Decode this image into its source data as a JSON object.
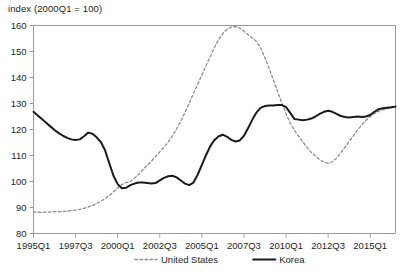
{
  "figure": {
    "clipped_title": "",
    "axis_note": "index (2000Q1 = 100)"
  },
  "chart_data": {
    "type": "line",
    "title": "",
    "subtitle": "index (2000Q1 = 100)",
    "xlabel": "",
    "ylabel": "index (2000Q1 = 100)",
    "ylim": [
      80,
      160
    ],
    "yticks": [
      80,
      90,
      100,
      110,
      120,
      130,
      140,
      150,
      160
    ],
    "ytick_labels": [
      "80",
      "90",
      "100",
      "110",
      "120",
      "130",
      "140",
      "150",
      "160"
    ],
    "xticks": [
      "1995Q1",
      "1997Q3",
      "2000Q1",
      "2002Q3",
      "2005Q1",
      "2007Q3",
      "2010Q1",
      "2012Q3",
      "2015Q1"
    ],
    "xtick_labels": [
      "1995Q1",
      "1997Q3",
      "2000Q1",
      "2002Q3",
      "2005Q1",
      "2007Q3",
      "2010Q1",
      "2012Q3",
      "2015Q1"
    ],
    "x_start": "1995Q1",
    "x_end": "2016Q3",
    "x_count": 87,
    "grid": false,
    "legend_position": "bottom-center",
    "colors": {
      "united_states": "#8c8c8c",
      "korea": "#1a1a1a",
      "axis": "#9a9a9a"
    },
    "series": [
      {
        "name": "United States",
        "style": "dotted",
        "color": "#8c8c8c",
        "values": [
          88.3,
          88.2,
          88.1,
          88.2,
          88.3,
          88.4,
          88.4,
          88.5,
          88.6,
          88.8,
          89.0,
          89.3,
          89.7,
          90.2,
          90.8,
          91.5,
          92.4,
          93.4,
          94.6,
          96.0,
          97.6,
          98.8,
          99.6,
          100.0,
          101.2,
          102.8,
          104.6,
          106.2,
          107.8,
          109.6,
          111.4,
          113.2,
          115.2,
          117.6,
          120.2,
          123.2,
          126.6,
          130.2,
          133.8,
          137.4,
          141.0,
          144.6,
          148.2,
          151.6,
          154.6,
          157.0,
          158.6,
          159.4,
          159.6,
          159.0,
          157.8,
          156.4,
          155.2,
          153.8,
          151.2,
          147.6,
          143.4,
          139.0,
          134.6,
          130.2,
          126.0,
          122.4,
          119.6,
          117.4,
          115.2,
          113.0,
          111.2,
          109.8,
          108.4,
          107.4,
          107.0,
          107.6,
          109.0,
          111.0,
          113.2,
          115.4,
          117.6,
          119.8,
          121.8,
          123.6,
          125.0,
          126.2,
          127.0,
          127.6,
          128.0,
          128.4,
          128.8
        ]
      },
      {
        "name": "Korea",
        "style": "solid",
        "color": "#1a1a1a",
        "values": [
          126.8,
          125.4,
          124.0,
          122.6,
          121.2,
          119.8,
          118.6,
          117.6,
          116.8,
          116.2,
          116.0,
          116.2,
          117.4,
          118.8,
          118.4,
          117.0,
          115.2,
          112.0,
          107.0,
          102.2,
          99.0,
          97.4,
          97.6,
          98.6,
          99.2,
          99.6,
          99.6,
          99.4,
          99.2,
          99.4,
          100.4,
          101.4,
          102.0,
          102.2,
          101.6,
          100.4,
          99.2,
          98.6,
          99.6,
          102.6,
          106.4,
          110.2,
          113.6,
          116.0,
          117.4,
          118.0,
          117.2,
          116.0,
          115.4,
          115.8,
          117.6,
          120.6,
          123.8,
          126.6,
          128.4,
          129.0,
          129.2,
          129.2,
          129.4,
          129.4,
          128.6,
          126.4,
          124.0,
          123.8,
          123.6,
          123.8,
          124.2,
          125.0,
          126.0,
          126.8,
          127.2,
          126.8,
          126.0,
          125.2,
          124.8,
          124.6,
          124.8,
          125.0,
          124.8,
          125.0,
          125.6,
          126.8,
          127.8,
          128.2,
          128.4,
          128.6,
          128.8
        ]
      }
    ],
    "legend": [
      {
        "label": "United States",
        "style": "dotted",
        "color": "#8c8c8c"
      },
      {
        "label": "Korea",
        "style": "solid",
        "color": "#1a1a1a"
      }
    ]
  }
}
